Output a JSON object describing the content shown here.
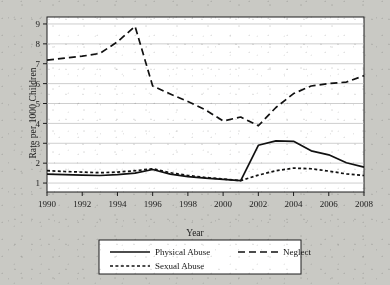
{
  "chart_data": {
    "type": "line",
    "title": "",
    "xlabel": "Year",
    "ylabel": "Rate per 1000 Children",
    "x": [
      1990,
      1991,
      1992,
      1993,
      1994,
      1995,
      1996,
      1997,
      1998,
      1999,
      2000,
      2001,
      2002,
      2003,
      2004,
      2005,
      2006,
      2007,
      2008
    ],
    "xticklabels": [
      "1990",
      "1992",
      "1994",
      "1996",
      "1998",
      "2000",
      "2002",
      "2004",
      "2006",
      "2008"
    ],
    "xticks": [
      1990,
      1992,
      1994,
      1996,
      1998,
      2000,
      2002,
      2004,
      2006,
      2008
    ],
    "xlim": [
      1990,
      2008
    ],
    "yticklabels": [
      "1",
      "2",
      "3",
      "4",
      "5",
      "6",
      "7",
      "8",
      "9"
    ],
    "yticks": [
      1,
      2,
      3,
      4,
      5,
      6,
      7,
      8,
      9
    ],
    "ylim": [
      0.55,
      9.35
    ],
    "grid": "horizontal",
    "legend_position": "below-axes",
    "series": [
      {
        "name": "Physical Abuse",
        "style": "solid",
        "color": "#111111",
        "values": [
          1.45,
          1.42,
          1.4,
          1.38,
          1.42,
          1.5,
          1.68,
          1.45,
          1.32,
          1.25,
          1.18,
          1.12,
          2.9,
          3.12,
          3.1,
          2.62,
          2.42,
          2.02,
          1.8
        ]
      },
      {
        "name": "Neglect",
        "style": "long-dash",
        "color": "#111111",
        "values": [
          7.18,
          7.28,
          7.38,
          7.52,
          8.1,
          8.88,
          5.88,
          5.48,
          5.1,
          4.68,
          4.12,
          4.32,
          3.88,
          4.8,
          5.5,
          5.88,
          6.0,
          6.08,
          6.4
        ]
      },
      {
        "name": "Sexual Abuse",
        "style": "short-dash",
        "color": "#111111",
        "values": [
          1.62,
          1.58,
          1.55,
          1.52,
          1.55,
          1.62,
          1.72,
          1.52,
          1.38,
          1.28,
          1.2,
          1.12,
          1.4,
          1.62,
          1.75,
          1.72,
          1.6,
          1.46,
          1.38
        ]
      }
    ]
  },
  "legend": {
    "items": [
      {
        "label": "Physical Abuse",
        "style": "solid"
      },
      {
        "label": "Neglect",
        "style": "long-dash"
      },
      {
        "label": "Sexual Abuse",
        "style": "short-dash"
      }
    ]
  },
  "colors": {
    "page_background": "#c9c9c4",
    "plot_background": "#ffffff",
    "axis": "#1c1c1c",
    "gridline": "#b9b9b9",
    "series": "#111111"
  }
}
